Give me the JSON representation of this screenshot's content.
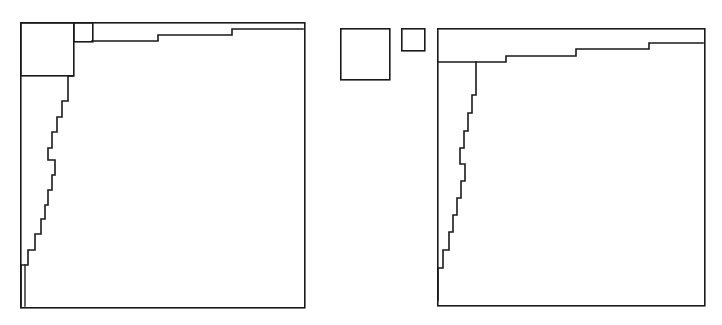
{
  "figure": {
    "width": 722,
    "height": 325,
    "background_color": "#ffffff",
    "stroke_color": "#1a1a1a",
    "stroke_width": 1.6
  },
  "chart_data": {
    "type": "diagram",
    "title": "",
    "xlabel": "",
    "ylabel": "",
    "grid": false,
    "legend": null,
    "panels": [
      {
        "name": "left-panel",
        "label": "",
        "outer_box": {
          "x": 20,
          "y": 22,
          "width": 284,
          "height": 285
        },
        "attached_squares": [
          {
            "name": "large-square",
            "x": 20,
            "y": 22,
            "width": 53,
            "height": 53
          },
          {
            "name": "small-square",
            "x": 73,
            "y": 22,
            "width": 19,
            "height": 19
          }
        ],
        "top_staircase": {
          "description": "descending steps from right edge toward the small square along the top",
          "points": [
            [
              92,
              41
            ],
            [
              158,
              41
            ],
            [
              158,
              35
            ],
            [
              232,
              35
            ],
            [
              232,
              29
            ],
            [
              303,
              29
            ]
          ]
        },
        "left_staircase": {
          "description": "rising steps from the bottom-left toward the large square along the left edge",
          "points": [
            [
              21,
              306
            ],
            [
              21,
              265
            ],
            [
              28,
              265
            ],
            [
              28,
              250
            ],
            [
              35,
              250
            ],
            [
              35,
              234
            ],
            [
              41,
              234
            ],
            [
              41,
              219
            ],
            [
              45,
              219
            ],
            [
              45,
              205
            ],
            [
              48,
              205
            ],
            [
              48,
              190
            ],
            [
              52,
              190
            ],
            [
              52,
              175
            ],
            [
              55,
              175
            ],
            [
              55,
              160
            ],
            [
              48,
              160
            ],
            [
              48,
              148
            ],
            [
              52,
              148
            ],
            [
              52,
              132
            ],
            [
              57,
              132
            ],
            [
              57,
              117
            ],
            [
              62,
              117
            ],
            [
              62,
              101
            ],
            [
              68,
              101
            ],
            [
              68,
              76
            ],
            [
              73,
              76
            ]
          ]
        }
      },
      {
        "name": "right-panel",
        "label": "",
        "outer_box": {
          "x": 437,
          "y": 28,
          "width": 267,
          "height": 277
        },
        "detached_squares": [
          {
            "name": "large-square",
            "x": 340,
            "y": 28,
            "width": 49,
            "height": 51
          },
          {
            "name": "small-square",
            "x": 401,
            "y": 28,
            "width": 23,
            "height": 22
          }
        ],
        "top_staircase": {
          "description": "descending steps from the right edge toward the left edge along the top",
          "points": [
            [
              438,
              62
            ],
            [
              506,
              62
            ],
            [
              506,
              56
            ],
            [
              576,
              56
            ],
            [
              576,
              49
            ],
            [
              649,
              49
            ],
            [
              649,
              43
            ],
            [
              703,
              43
            ]
          ]
        },
        "left_staircase": {
          "description": "rising steps from the bottom-left toward the top-left corner",
          "points": [
            [
              438,
              300
            ],
            [
              438,
              268
            ],
            [
              443,
              268
            ],
            [
              443,
              250
            ],
            [
              449,
              250
            ],
            [
              449,
              232
            ],
            [
              453,
              232
            ],
            [
              453,
              215
            ],
            [
              457,
              215
            ],
            [
              457,
              198
            ],
            [
              461,
              198
            ],
            [
              461,
              181
            ],
            [
              465,
              181
            ],
            [
              465,
              164
            ],
            [
              460,
              164
            ],
            [
              460,
              148
            ],
            [
              464,
              148
            ],
            [
              464,
              131
            ],
            [
              468,
              131
            ],
            [
              468,
              113
            ],
            [
              472,
              113
            ],
            [
              472,
              95
            ],
            [
              476,
              95
            ],
            [
              476,
              62
            ]
          ]
        }
      }
    ]
  }
}
